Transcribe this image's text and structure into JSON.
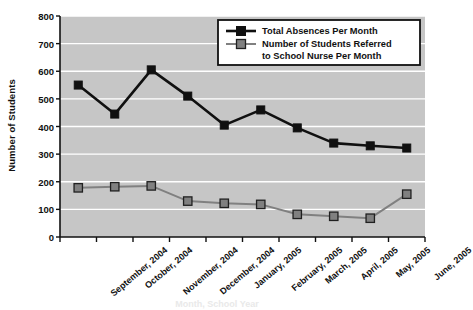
{
  "chart_data": {
    "type": "line",
    "title": "",
    "xlabel": "Month, School Year",
    "ylabel": "Number of Students",
    "categories": [
      "September, 2004",
      "October, 2004",
      "November, 2004",
      "December, 2004",
      "January, 2005",
      "February, 2005",
      "March, 2005",
      "April, 2005",
      "May, 2005",
      "June, 2005"
    ],
    "series": [
      {
        "name": "Total Absences Per Month",
        "color": "#101010",
        "marker": "square",
        "values": [
          550,
          445,
          605,
          510,
          405,
          460,
          395,
          340,
          330,
          322
        ]
      },
      {
        "name": "Number of Students Referred to School Nurse Per Month",
        "color": "#808080",
        "marker": "square",
        "values": [
          178,
          182,
          185,
          130,
          122,
          118,
          82,
          75,
          68,
          155
        ]
      }
    ],
    "ylim": [
      0,
      800
    ],
    "yticks": [
      0,
      100,
      200,
      300,
      400,
      500,
      600,
      700,
      800
    ],
    "ytick_labels": [
      "0",
      "100",
      "200",
      "300",
      "400",
      "500",
      "600",
      "700",
      "800"
    ],
    "grid": true,
    "grid_color": "#ffffff",
    "plot_background": "#c6c6c6",
    "legend_position": "top-right",
    "legend_entries": [
      "Total Absences Per Month",
      "Number of Students Referred",
      "to School Nurse Per Month"
    ]
  }
}
